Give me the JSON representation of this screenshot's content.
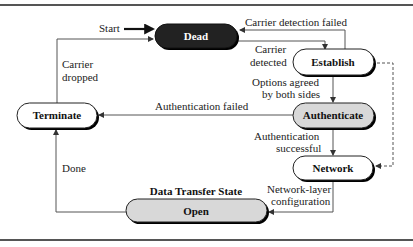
{
  "diagram": {
    "type": "state-transition",
    "states": [
      {
        "id": "dead",
        "label": "Dead",
        "fill": "#222222",
        "text_color": "#ffffff"
      },
      {
        "id": "establish",
        "label": "Establish",
        "fill": "#ffffff",
        "text_color": "#111111"
      },
      {
        "id": "authenticate",
        "label": "Authenticate",
        "fill": "#d8d8d8",
        "text_color": "#111111"
      },
      {
        "id": "network",
        "label": "Network",
        "fill": "#ffffff",
        "text_color": "#111111"
      },
      {
        "id": "open",
        "label": "Open",
        "fill": "#d8d8d8",
        "text_color": "#111111"
      },
      {
        "id": "terminate",
        "label": "Terminate",
        "fill": "#ffffff",
        "text_color": "#111111"
      }
    ],
    "open_caption": "Data Transfer State",
    "transitions": {
      "start": "Start",
      "carrier_detection_failed": "Carrier detection failed",
      "carrier_detected_1": "Carrier",
      "carrier_detected_2": "detected",
      "options_agreed_1": "Options agreed",
      "options_agreed_2": "by both sides",
      "authentication_failed": "Authentication failed",
      "authentication_successful_1": "Authentication",
      "authentication_successful_2": "successful",
      "network_layer_1": "Network-layer",
      "network_layer_2": "configuration",
      "done": "Done",
      "carrier_dropped_1": "Carrier",
      "carrier_dropped_2": "dropped"
    }
  }
}
